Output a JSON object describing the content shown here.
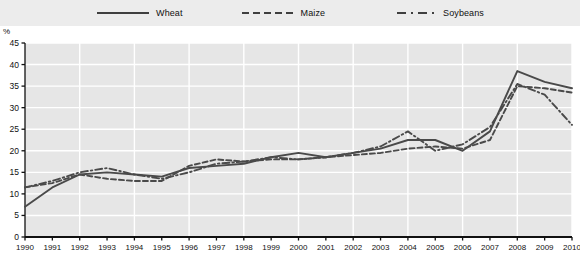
{
  "legend": {
    "entries": [
      {
        "label": "Wheat",
        "style": "solid",
        "icon": "line-solid-icon"
      },
      {
        "label": "Maize",
        "style": "dashed",
        "icon": "line-dashed-icon"
      },
      {
        "label": "Soybeans",
        "style": "dashdot",
        "icon": "line-dashdot-icon"
      }
    ]
  },
  "axes": {
    "y_unit": "%",
    "y_ticks": [
      "0",
      "5",
      "10",
      "15",
      "20",
      "25",
      "30",
      "35",
      "40",
      "45"
    ],
    "x_ticks": [
      "1990",
      "1991",
      "1992",
      "1993",
      "1994",
      "1995",
      "1996",
      "1997",
      "1998",
      "1999",
      "2000",
      "2001",
      "2002",
      "2003",
      "2004",
      "2005",
      "2006",
      "2007",
      "2008",
      "2009",
      "2010"
    ]
  },
  "colors": {
    "series_line": "#4a4a4a",
    "plot_background": "#e6e6e6",
    "gridline": "#ffffff",
    "axis": "#111111",
    "legend_background": "#ececec"
  },
  "chart_data": {
    "type": "line",
    "title": "",
    "xlabel": "",
    "ylabel": "%",
    "ylim": [
      0,
      45
    ],
    "grid": true,
    "legend_position": "top",
    "x": [
      "1990",
      "1991",
      "1992",
      "1993",
      "1994",
      "1995",
      "1996",
      "1997",
      "1998",
      "1999",
      "2000",
      "2001",
      "2002",
      "2003",
      "2004",
      "2005",
      "2006",
      "2007",
      "2008",
      "2009",
      "2010"
    ],
    "series": [
      {
        "name": "Wheat",
        "style": "solid",
        "values": [
          7.0,
          11.5,
          14.5,
          15.0,
          14.5,
          14.0,
          16.0,
          16.5,
          17.0,
          18.5,
          19.5,
          18.5,
          19.5,
          20.5,
          22.5,
          22.5,
          20.0,
          24.5,
          38.5,
          36.0,
          34.5
        ]
      },
      {
        "name": "Maize",
        "style": "dashed",
        "values": [
          11.5,
          12.5,
          14.5,
          13.5,
          13.0,
          13.0,
          16.5,
          18.0,
          17.5,
          18.0,
          18.0,
          18.5,
          19.0,
          19.5,
          20.5,
          21.0,
          20.5,
          22.5,
          35.0,
          34.5,
          33.5
        ]
      },
      {
        "name": "Soybeans",
        "style": "dashdot",
        "values": [
          11.5,
          13.0,
          15.0,
          16.0,
          14.5,
          13.5,
          15.0,
          17.0,
          17.5,
          18.5,
          18.0,
          18.5,
          19.5,
          21.0,
          24.5,
          20.0,
          21.5,
          25.5,
          35.5,
          33.0,
          26.0
        ]
      }
    ]
  }
}
